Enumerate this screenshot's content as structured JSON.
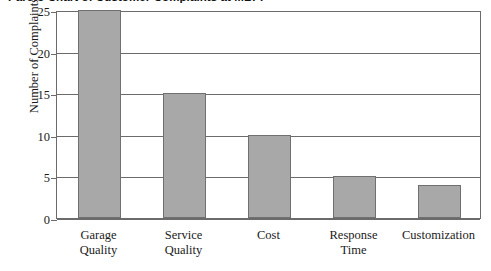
{
  "chart_data": {
    "type": "bar",
    "title": "Pareto Chart of Customer Complaints at MBPF",
    "xlabel": "",
    "ylabel": "Number of Complaints",
    "ylim": [
      0,
      25
    ],
    "yticks": [
      0,
      5,
      10,
      15,
      20,
      25
    ],
    "grid": true,
    "legend": false,
    "categories": [
      "Garage Quality",
      "Service Quality",
      "Cost",
      "Response Time",
      "Customization"
    ],
    "category_lines": [
      [
        "Garage",
        "Quality"
      ],
      [
        "Service",
        "Quality"
      ],
      [
        "Cost",
        ""
      ],
      [
        "Response",
        "Time"
      ],
      [
        "Customization",
        ""
      ]
    ],
    "values": [
      25,
      15,
      10,
      5,
      4
    ],
    "colors": {
      "bar_fill": "#a8a8a8",
      "bar_border": "#707070",
      "axis": "#6b6b6b",
      "text": "#1a1a1a",
      "background": "#ffffff"
    }
  }
}
